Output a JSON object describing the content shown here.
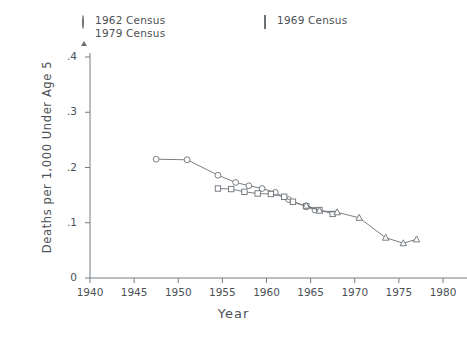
{
  "chart_data": {
    "type": "line",
    "title": "",
    "xlabel": "Year",
    "ylabel": "Deaths per 1,000 Under Age 5",
    "xlim": [
      1940,
      1980
    ],
    "ylim": [
      0,
      0.4
    ],
    "xticks": [
      1940,
      1945,
      1950,
      1955,
      1960,
      1965,
      1970,
      1975,
      1980
    ],
    "xtick_labels": [
      "1940",
      "1945",
      "1950",
      "1955",
      "1960",
      "1965",
      "1970",
      "1975",
      "1980"
    ],
    "yticks": [
      0,
      0.1,
      0.2,
      0.3,
      0.4
    ],
    "ytick_labels": [
      "0",
      ".1",
      ".2",
      ".3",
      ".4"
    ],
    "grid": false,
    "legend_position": "above-plot",
    "series": [
      {
        "name": "1962 Census",
        "marker": "circle",
        "x": [
          1947.5,
          1951,
          1954.5,
          1956.5,
          1958,
          1959.5,
          1961,
          1962.5,
          1964.5,
          1965.5
        ],
        "y": [
          0.215,
          0.214,
          0.186,
          0.173,
          0.167,
          0.162,
          0.155,
          0.142,
          0.129,
          0.123
        ]
      },
      {
        "name": "1969 Census",
        "marker": "square",
        "x": [
          1954.5,
          1956,
          1957.5,
          1959,
          1960.5,
          1962,
          1963,
          1964.5,
          1966,
          1967.5
        ],
        "y": [
          0.162,
          0.161,
          0.156,
          0.153,
          0.152,
          0.147,
          0.138,
          0.13,
          0.123,
          0.116
        ]
      },
      {
        "name": "1979 Census",
        "marker": "triangle",
        "x": [
          1964.5,
          1966,
          1968,
          1970.5,
          1973.5,
          1975.5,
          1977
        ],
        "y": [
          0.131,
          0.122,
          0.119,
          0.109,
          0.073,
          0.063,
          0.07
        ]
      }
    ]
  },
  "legend": {
    "entries": [
      {
        "label": "1962 Census",
        "marker": "circle-marker-icon"
      },
      {
        "label": "1979 Census",
        "marker": "triangle-marker-icon"
      },
      {
        "label": "1969 Census",
        "marker": "square-marker-icon"
      }
    ]
  },
  "axes": {
    "y_title": "Deaths per 1,000 Under Age 5",
    "x_title": "Year",
    "y_tick_labels": [
      "0",
      ".1",
      ".2",
      ".3",
      ".4"
    ],
    "x_tick_labels": [
      "1940",
      "1945",
      "1950",
      "1955",
      "1960",
      "1965",
      "1970",
      "1975",
      "1980"
    ]
  },
  "caption": {
    "text": ""
  },
  "colors": {
    "line": "#6b7075",
    "text": "#4c5155",
    "axis": "#777c80",
    "background": "#ffffff"
  }
}
